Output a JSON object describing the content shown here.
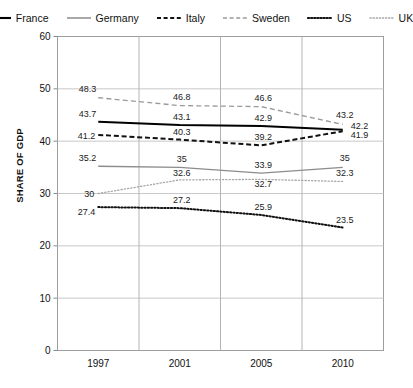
{
  "chart_data": {
    "type": "line",
    "title": "",
    "xlabel": "",
    "ylabel": "SHARE OF GDP",
    "categories": [
      "1997",
      "2001",
      "2005",
      "2010"
    ],
    "ylim": [
      0,
      60
    ],
    "yticks": [
      "0",
      "10",
      "20",
      "30",
      "40",
      "50",
      "60"
    ],
    "grid": true,
    "legend_position": "top",
    "series": [
      {
        "name": "France",
        "style": "solid-thick",
        "color": "#000000",
        "values": [
          43.7,
          43.1,
          42.9,
          42.2
        ],
        "labels": [
          "43.7",
          "43.1",
          "42.9",
          "42.2"
        ]
      },
      {
        "name": "Germany",
        "style": "solid-thin",
        "color": "#8c8c8c",
        "values": [
          35.2,
          35,
          33.9,
          35
        ],
        "labels": [
          "35.2",
          "35",
          "33.9",
          "35"
        ]
      },
      {
        "name": "Italy",
        "style": "dashed-bold",
        "color": "#111111",
        "values": [
          41.2,
          40.3,
          39.2,
          41.9
        ],
        "labels": [
          "41.2",
          "40.3",
          "39.2",
          "41.9"
        ]
      },
      {
        "name": "Sweden",
        "style": "dashed-light",
        "color": "#9a9a9a",
        "values": [
          48.3,
          46.8,
          46.6,
          43.2
        ],
        "labels": [
          "48.3",
          "46.8",
          "46.6",
          "43.2"
        ]
      },
      {
        "name": "US",
        "style": "dotted-bold",
        "color": "#111111",
        "values": [
          27.4,
          27.2,
          25.9,
          23.5
        ],
        "labels": [
          "27.4",
          "27.2",
          "25.9",
          "23.5"
        ]
      },
      {
        "name": "UK",
        "style": "dotted-light",
        "color": "#a6a6a6",
        "values": [
          30,
          32.6,
          32.7,
          32.3
        ],
        "labels": [
          "30",
          "32.6",
          "32.7",
          "32.3"
        ]
      }
    ]
  },
  "legend": {
    "items": [
      {
        "label": "France"
      },
      {
        "label": "Germany"
      },
      {
        "label": "Italy"
      },
      {
        "label": "Sweden"
      },
      {
        "label": "US"
      },
      {
        "label": "UK"
      }
    ]
  },
  "axes": {
    "y_title": "SHARE OF GDP"
  }
}
